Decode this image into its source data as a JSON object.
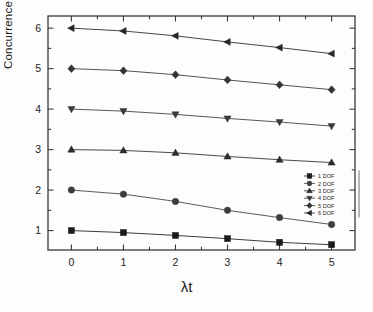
{
  "chart_data": {
    "type": "line",
    "title": "",
    "xlabel": "λt",
    "ylabel": "Concurrence",
    "x": [
      0,
      1,
      2,
      3,
      4,
      5
    ],
    "xlim": [
      -0.45,
      5.45
    ],
    "ylim": [
      0.52,
      6.3
    ],
    "xticks": [
      "0",
      "1",
      "2",
      "3",
      "4",
      "5"
    ],
    "yticks": [
      "1",
      "2",
      "3",
      "4",
      "5",
      "6"
    ],
    "grid": false,
    "minor_ticks": true,
    "legend_position": "right-middle-inside",
    "series": [
      {
        "name": "1 DOF",
        "marker": "square",
        "color": "#1a1a1a",
        "values": [
          1.0,
          0.95,
          0.88,
          0.8,
          0.71,
          0.65
        ]
      },
      {
        "name": "2 DOF",
        "marker": "circle",
        "color": "#3d3d3d",
        "values": [
          2.0,
          1.9,
          1.72,
          1.5,
          1.32,
          1.15
        ]
      },
      {
        "name": "3 DOF",
        "marker": "triangle-up",
        "color": "#2b2b2b",
        "values": [
          3.0,
          2.98,
          2.92,
          2.83,
          2.75,
          2.68
        ]
      },
      {
        "name": "4 DOF",
        "marker": "triangle-down",
        "color": "#3a3a3a",
        "values": [
          4.0,
          3.95,
          3.87,
          3.77,
          3.68,
          3.58
        ]
      },
      {
        "name": "5 DOF",
        "marker": "diamond",
        "color": "#343434",
        "values": [
          5.0,
          4.95,
          4.85,
          4.72,
          4.6,
          4.48
        ]
      },
      {
        "name": "6 DOF",
        "marker": "triangle-left",
        "color": "#262626",
        "values": [
          6.0,
          5.93,
          5.81,
          5.66,
          5.52,
          5.37
        ]
      }
    ]
  },
  "axes": {
    "frame_color": "#3a3a3a",
    "line_color": "#4a4a4a"
  },
  "legend": {
    "items": [
      {
        "label": "1 DOF"
      },
      {
        "label": "2 DOF"
      },
      {
        "label": "3 DOF"
      },
      {
        "label": "4 DOF"
      },
      {
        "label": "5 DOF"
      },
      {
        "label": "6 DOF"
      }
    ]
  }
}
